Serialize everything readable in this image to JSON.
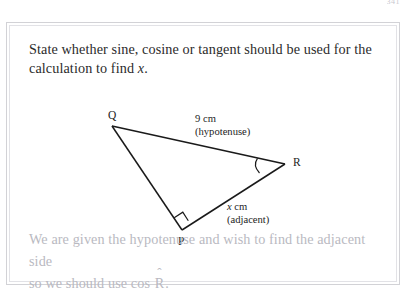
{
  "page": {
    "number": "341"
  },
  "question": {
    "line1": "State whether sine, cosine or tangent should be used for the",
    "line2_prefix": "calculation to find ",
    "line2_var": "x",
    "line2_suffix": "."
  },
  "diagram": {
    "type": "right-triangle",
    "vertices": {
      "Q": {
        "label": "Q",
        "x": 105,
        "y": 103
      },
      "R": {
        "label": "R",
        "x": 278,
        "y": 141
      },
      "P": {
        "label": "P",
        "x": 175,
        "y": 207
      }
    },
    "right_angle_at": "P",
    "marked_angle_at": "R",
    "sides": [
      {
        "name": "hypotenuse",
        "between": "Q-R",
        "length_label": "9 cm",
        "role_label": "(hypotenuse)"
      },
      {
        "name": "adjacent",
        "between": "P-R",
        "length_var": "x",
        "length_unit": " cm",
        "role_label": "(adjacent)"
      }
    ],
    "stroke_color": "#1a1a1a"
  },
  "answer": {
    "line1": "We are given the hypotenuse and wish to find the adjacent side",
    "line2_prefix": "so we should use cos ",
    "line2_symbol": "R",
    "line2_hat": "ˆ",
    "line2_suffix": ".",
    "color": "#b9b9c1"
  }
}
